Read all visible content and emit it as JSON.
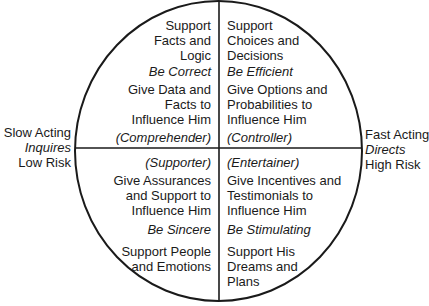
{
  "axes": {
    "left": {
      "line1": "Slow Acting",
      "line2": "Inquires",
      "line3": "Low Risk"
    },
    "right": {
      "line1": "Fast Acting",
      "line2": "Directs",
      "line3": "High Risk"
    }
  },
  "quadrants": {
    "top_left": {
      "support": [
        "Support",
        "Facts and",
        "Logic"
      ],
      "motto": "Be Correct",
      "influence": [
        "Give Data and",
        "Facts to",
        "Influence Him"
      ],
      "type": "(Comprehender)"
    },
    "top_right": {
      "support": [
        "Support",
        "Choices and",
        "Decisions"
      ],
      "motto": "Be Efficient",
      "influence": [
        "Give Options and",
        "Probabilities to",
        "Influence Him"
      ],
      "type": "(Controller)"
    },
    "bottom_left": {
      "type": "(Supporter)",
      "influence": [
        "Give Assurances",
        "and Support to",
        "Influence Him"
      ],
      "motto": "Be Sincere",
      "support": [
        "Support People",
        "and Emotions"
      ]
    },
    "bottom_right": {
      "type": "(Entertainer)",
      "influence": [
        "Give Incentives and",
        "Testimonials to",
        "Influence Him"
      ],
      "motto": "Be Stimulating",
      "support": [
        "Support His",
        "Dreams and",
        "Plans"
      ]
    }
  },
  "colors": {
    "stroke": "#1a1a1a",
    "background": "#ffffff"
  }
}
